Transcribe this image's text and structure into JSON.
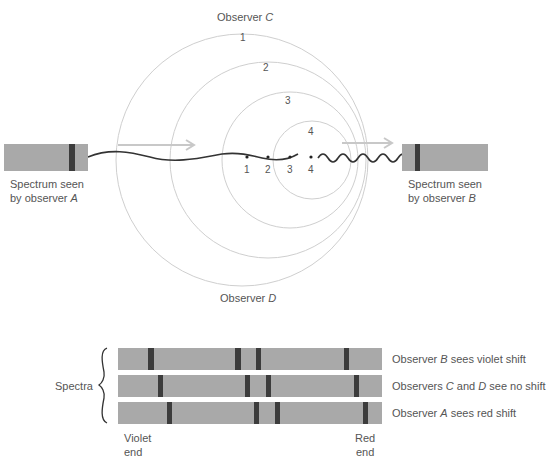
{
  "diagram": {
    "observer_c_label": "Observer",
    "observer_c_letter": "C",
    "observer_d_label": "Observer",
    "observer_d_letter": "D",
    "wavefront_labels": [
      "1",
      "2",
      "3",
      "4"
    ],
    "source_position_labels": [
      "1",
      "2",
      "3",
      "4"
    ],
    "spectrum_a": {
      "line1": "Spectrum seen",
      "line2_prefix": "by observer",
      "letter": "A"
    },
    "spectrum_b": {
      "line1": "Spectrum seen",
      "line2_prefix": "by observer",
      "letter": "B"
    },
    "colors": {
      "circle": "#cfcfcf",
      "wave": "#333333",
      "arrow": "#c8c8c8",
      "spectrum_fill": "#a9a9a9",
      "spectral_line": "#3c3c3c"
    }
  },
  "spectra_panel": {
    "brace_label": "Spectra",
    "rows": [
      {
        "prefix": "Observer",
        "letter": "B",
        "suffix": "sees violet shift"
      },
      {
        "prefix": "Observers",
        "letter1": "C",
        "mid": "and",
        "letter2": "D",
        "suffix": "see no shift"
      },
      {
        "prefix": "Observer",
        "letter": "A",
        "suffix": "sees red shift"
      }
    ],
    "violet_end": [
      "Violet",
      "end"
    ],
    "red_end": [
      "Red",
      "end"
    ]
  }
}
